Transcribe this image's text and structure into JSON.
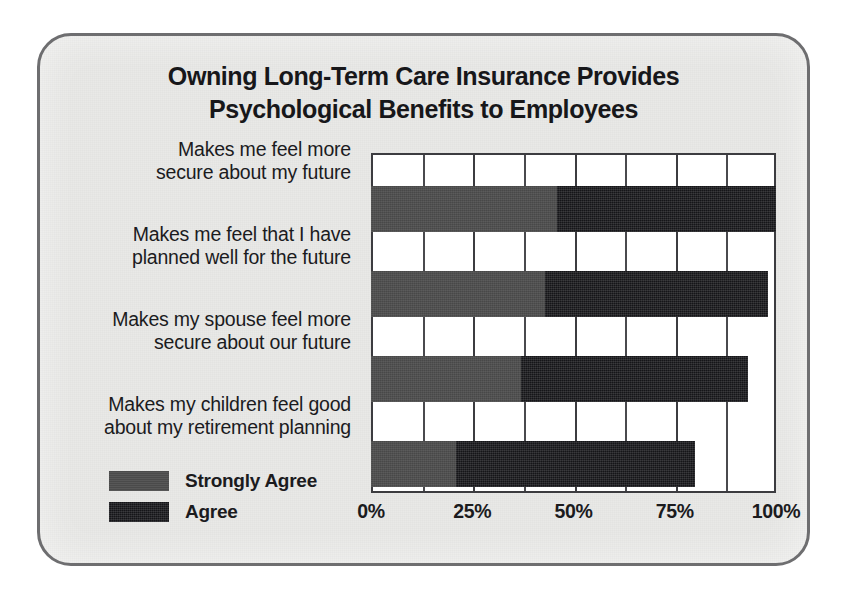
{
  "chart": {
    "title_lines": [
      "Owning Long-Term Care Insurance Provides",
      "Psychological Benefits to Employees"
    ],
    "legend": [
      {
        "label": "Strongly Agree",
        "color": "#4e4e4e",
        "swatch_icon": "legend-swatch-strongly-agree"
      },
      {
        "label": "Agree",
        "color": "#17171a",
        "swatch_icon": "legend-swatch-agree"
      }
    ],
    "xticks": [
      "0%",
      "25%",
      "50%",
      "75%",
      "100%"
    ],
    "categories": [
      {
        "lines": [
          "Makes me feel more",
          "secure about my future"
        ]
      },
      {
        "lines": [
          "Makes me feel that I have",
          "planned well for the future"
        ]
      },
      {
        "lines": [
          "Makes my spouse feel more",
          "secure about our future"
        ]
      },
      {
        "lines": [
          "Makes my children feel good",
          "about my retirement planning"
        ]
      }
    ]
  },
  "chart_data": {
    "type": "bar",
    "orientation": "horizontal",
    "stacked": true,
    "title": "Owning Long-Term Care Insurance Provides Psychological Benefits to Employees",
    "xlabel": "",
    "ylabel": "",
    "xlim": [
      0,
      100
    ],
    "xticks": [
      0,
      25,
      50,
      75,
      100
    ],
    "xtick_labels": [
      "0%",
      "25%",
      "50%",
      "75%",
      "100%"
    ],
    "minor_gridlines": [
      12.5,
      37.5,
      62.5,
      87.5
    ],
    "grid": true,
    "legend_position": "bottom-left",
    "units": "percent",
    "categories": [
      "Makes me feel more secure about my future",
      "Makes me feel that I have planned well for the future",
      "Makes my spouse feel more secure about our future",
      "Makes my children feel good about my retirement planning"
    ],
    "series": [
      {
        "name": "Strongly Agree",
        "color": "#4e4e4e",
        "values": [
          46,
          43,
          37,
          21
        ]
      },
      {
        "name": "Agree",
        "color": "#17171a",
        "values": [
          54,
          55,
          56,
          59
        ]
      }
    ],
    "totals": [
      100,
      98,
      93,
      80
    ]
  }
}
